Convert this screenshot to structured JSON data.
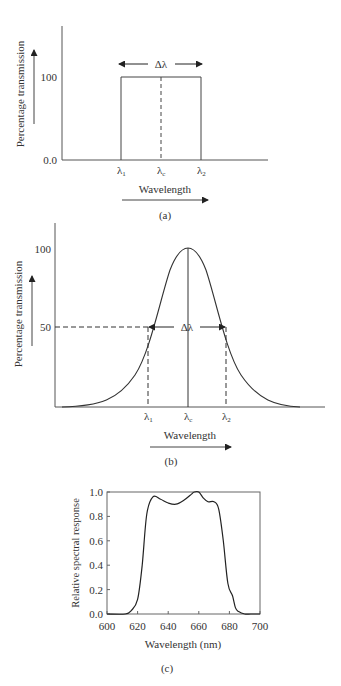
{
  "chart_data": [
    {
      "panel": "(a)",
      "type": "line",
      "title": "",
      "xlabel": "Wavelength",
      "ylabel": "Percentage transmission",
      "yticks": [
        "0.0",
        "100"
      ],
      "xticks": [
        "λ1",
        "λc",
        "λ2"
      ],
      "annotation": "Δλ",
      "shape": "rectangular passband",
      "x": [
        "λ1",
        "λ1",
        "λ2",
        "λ2"
      ],
      "values": [
        0,
        100,
        100,
        0
      ]
    },
    {
      "panel": "(b)",
      "type": "line",
      "title": "",
      "xlabel": "Wavelength",
      "ylabel": "Percentage transmission",
      "yticks": [
        "50",
        "100"
      ],
      "xticks": [
        "λ1",
        "λc",
        "λ2"
      ],
      "annotation": "Δλ",
      "shape": "gaussian passband, FWHM Δλ between λ1 and λ2 at 50%",
      "peak": 100,
      "half_max": 50
    },
    {
      "panel": "(c)",
      "type": "line",
      "title": "",
      "xlabel": "Wavelength (nm)",
      "ylabel": "Relative spectral response",
      "xlim": [
        600,
        700
      ],
      "ylim": [
        0.0,
        1.0
      ],
      "xticks": [
        600,
        620,
        640,
        660,
        680,
        700
      ],
      "yticks": [
        "0.0",
        "0.2",
        "0.4",
        "0.6",
        "0.8",
        "1.0"
      ],
      "grid": false,
      "x": [
        600,
        612,
        616,
        620,
        623,
        626,
        630,
        635,
        640,
        645,
        650,
        655,
        657,
        660,
        663,
        666,
        670,
        673,
        676,
        679,
        682,
        684,
        686,
        690,
        694,
        700
      ],
      "values": [
        0.0,
        0.0,
        0.03,
        0.12,
        0.4,
        0.82,
        0.96,
        0.94,
        0.91,
        0.9,
        0.93,
        0.98,
        1.0,
        1.0,
        0.95,
        0.92,
        0.92,
        0.86,
        0.6,
        0.25,
        0.15,
        0.05,
        0.02,
        0.0,
        0.0,
        0.0
      ]
    }
  ],
  "labels": {
    "a": {
      "ylabel": "Percentage transmission",
      "y100": "100",
      "y0": "0.0",
      "lambda1": "λ",
      "lambda1_sub": "1",
      "lambdac": "λ",
      "lambdac_sub": "c",
      "lambda2": "λ",
      "lambda2_sub": "2",
      "delta": "Δλ",
      "xlabel": "Wavelength",
      "caption": "(a)"
    },
    "b": {
      "ylabel": "Percentage transmission",
      "y100": "100",
      "y50": "50",
      "lambda1": "λ",
      "lambda1_sub": "1",
      "lambdac": "λ",
      "lambdac_sub": "c",
      "lambda2": "λ",
      "lambda2_sub": "2",
      "delta": "Δλ",
      "xlabel": "Wavelength",
      "caption": "(b)"
    },
    "c": {
      "ylabel": "Relative spectral response",
      "xlabel": "Wavelength (nm)",
      "yticks": [
        "0.0",
        "0.2",
        "0.4",
        "0.6",
        "0.8",
        "1.0"
      ],
      "xticks": [
        "600",
        "620",
        "640",
        "660",
        "680",
        "700"
      ],
      "caption": "(c)"
    }
  }
}
